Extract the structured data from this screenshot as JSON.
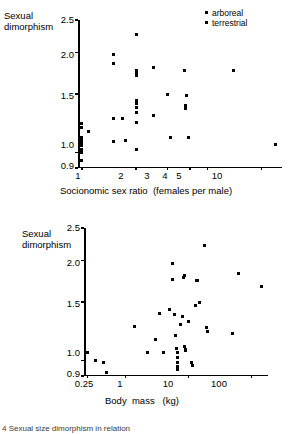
{
  "figure": {
    "caption": "4 Sexual size dimorphism in relation"
  },
  "legend": {
    "items": [
      {
        "label": "arboreal",
        "marker": "square-marker-icon"
      },
      {
        "label": "terrestrial",
        "marker": "square-marker-icon"
      }
    ]
  },
  "panels": {
    "top": {
      "ylabel_line1": "Sexual",
      "ylabel_line2": "dimorphism",
      "xlabel": "Socionomic sex ratio  (females per male)",
      "yticks": [
        "2.5",
        "2.0",
        "1.5",
        "1.0",
        "0.9"
      ],
      "xticks": [
        "1",
        "2",
        "3",
        "4",
        "5",
        "10"
      ]
    },
    "bottom": {
      "ylabel_line1": "Sexual",
      "ylabel_line2": "dimorphism",
      "xlabel": "Body  mass   (kg)",
      "yticks": [
        "2.5",
        "2.0",
        "1.5",
        "1.0",
        "0.9"
      ],
      "xticks": [
        "0.25",
        "1",
        "10",
        "100"
      ]
    }
  },
  "chart_data": [
    {
      "type": "scatter",
      "title": "",
      "xlabel": "Socionomic sex ratio  (females per male)",
      "ylabel": "Sexual dimorphism",
      "xscale": "log",
      "yscale": "log",
      "xlim": [
        0.95,
        13
      ],
      "ylim": [
        0.9,
        2.5
      ],
      "xticks": [
        1,
        2,
        3,
        4,
        5,
        10
      ],
      "yticks": [
        0.9,
        1.0,
        1.5,
        2.0,
        2.5
      ],
      "grid": false,
      "legend_position": "top-right",
      "series": [
        {
          "name": "combined",
          "points": [
            [
              1.0,
              0.95
            ],
            [
              1.0,
              1.0
            ],
            [
              1.0,
              1.02
            ],
            [
              1.0,
              1.05
            ],
            [
              1.0,
              1.07
            ],
            [
              1.0,
              1.09
            ],
            [
              1.0,
              1.11
            ],
            [
              1.0,
              1.19
            ],
            [
              1.0,
              1.22
            ],
            [
              1.08,
              1.16
            ],
            [
              1.5,
              1.97
            ],
            [
              1.5,
              1.85
            ],
            [
              1.5,
              1.27
            ],
            [
              1.5,
              1.08
            ],
            [
              1.68,
              1.27
            ],
            [
              1.75,
              1.09
            ],
            [
              2.0,
              2.26
            ],
            [
              2.0,
              1.77
            ],
            [
              2.0,
              1.74
            ],
            [
              2.0,
              1.72
            ],
            [
              2.0,
              1.7
            ],
            [
              2.0,
              1.43
            ],
            [
              2.0,
              1.4
            ],
            [
              2.0,
              1.37
            ],
            [
              2.0,
              1.32
            ],
            [
              2.0,
              1.23
            ],
            [
              2.0,
              1.02
            ],
            [
              2.5,
              1.8
            ],
            [
              2.5,
              1.29
            ],
            [
              3.0,
              1.5
            ],
            [
              3.1,
              1.11
            ],
            [
              3.7,
              1.76
            ],
            [
              3.8,
              1.48
            ],
            [
              3.75,
              1.39
            ],
            [
              3.75,
              1.36
            ],
            [
              3.9,
              1.11
            ],
            [
              7.0,
              1.76
            ],
            [
              12.0,
              1.06
            ]
          ]
        }
      ]
    },
    {
      "type": "scatter",
      "title": "",
      "xlabel": "Body  mass   (kg)",
      "ylabel": "Sexual dimorphism",
      "xscale": "log",
      "yscale": "log",
      "xlim": [
        0.22,
        180
      ],
      "ylim": [
        0.9,
        2.5
      ],
      "xticks": [
        0.25,
        1,
        10,
        100
      ],
      "yticks": [
        0.9,
        1.0,
        1.5,
        2.0,
        2.5
      ],
      "grid": false,
      "legend_position": "none",
      "series": [
        {
          "name": "combined",
          "points": [
            [
              0.25,
              1.06
            ],
            [
              0.33,
              1.0
            ],
            [
              0.45,
              0.99
            ],
            [
              0.5,
              0.92
            ],
            [
              1.4,
              1.27
            ],
            [
              2.2,
              1.06
            ],
            [
              3.0,
              1.16
            ],
            [
              3.5,
              1.39
            ],
            [
              4.0,
              1.06
            ],
            [
              5.0,
              1.42
            ],
            [
              5.5,
              1.95
            ],
            [
              5.5,
              1.75
            ],
            [
              6.0,
              1.38
            ],
            [
              6.2,
              1.19
            ],
            [
              6.5,
              1.09
            ],
            [
              6.6,
              1.06
            ],
            [
              6.6,
              1.02
            ],
            [
              6.6,
              0.99
            ],
            [
              6.6,
              0.96
            ],
            [
              6.6,
              0.94
            ],
            [
              7.5,
              1.28
            ],
            [
              8.0,
              1.36
            ],
            [
              8.2,
              1.78
            ],
            [
              8.6,
              1.8
            ],
            [
              8.5,
              1.1
            ],
            [
              8.8,
              1.08
            ],
            [
              9.0,
              1.07
            ],
            [
              10.0,
              1.31
            ],
            [
              11.0,
              0.99
            ],
            [
              11.5,
              0.97
            ],
            [
              13.0,
              1.46
            ],
            [
              13.5,
              1.74
            ],
            [
              14.0,
              1.74
            ],
            [
              15.0,
              1.5
            ],
            [
              18.0,
              2.21
            ],
            [
              19.0,
              1.26
            ],
            [
              20.0,
              1.22
            ],
            [
              50.0,
              1.21
            ],
            [
              62.0,
              1.82
            ],
            [
              140.0,
              1.67
            ]
          ]
        }
      ]
    }
  ]
}
